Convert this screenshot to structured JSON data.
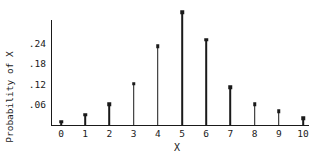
{
  "chart_data": {
    "type": "bar",
    "subtype": "stem",
    "title": "",
    "xlabel": "X",
    "ylabel": "Probability of X",
    "categories": [
      "0",
      "1",
      "2",
      "3",
      "4",
      "5",
      "6",
      "7",
      "8",
      "9",
      "10"
    ],
    "x": [
      0,
      1,
      2,
      3,
      4,
      5,
      6,
      7,
      8,
      9,
      10
    ],
    "values": [
      0.01,
      0.03,
      0.06,
      0.12,
      0.23,
      0.33,
      0.25,
      0.11,
      0.06,
      0.04,
      0.02
    ],
    "yticks": [
      ".06",
      ".12",
      ".18",
      ".24"
    ],
    "ytick_values": [
      0.06,
      0.12,
      0.18,
      0.24
    ],
    "ylim": [
      0,
      0.34
    ],
    "xlim": [
      -0.4,
      10.5
    ],
    "grid": false,
    "legend": null
  },
  "labels": {
    "ylabel": "Probability of X",
    "xlabel": "X"
  }
}
